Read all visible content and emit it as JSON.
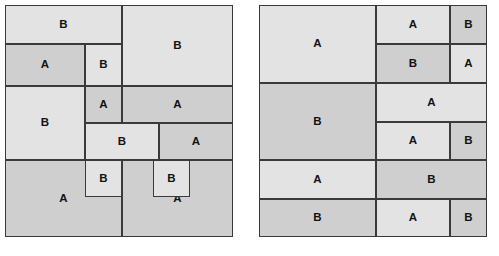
{
  "figure": {
    "background": "#ffffff",
    "stroke_color": "#3a3a3a",
    "shade_light": "#e3e3e3",
    "shade_dark": "#cfcfcf",
    "label_a": "A",
    "label_b": "B",
    "caption_left": "",
    "caption_right": ""
  },
  "panels": [
    {
      "name": "left-partition",
      "x": 5,
      "y": 5,
      "w": 228,
      "h": 232,
      "rects": [
        {
          "id": "l1",
          "label": "B",
          "shade": "light",
          "x": 0,
          "y": 0,
          "w": 117,
          "h": 39
        },
        {
          "id": "l2",
          "label": "A",
          "shade": "dark",
          "x": 0,
          "y": 39,
          "w": 80,
          "h": 42
        },
        {
          "id": "l3",
          "label": "B",
          "shade": "light",
          "x": 80,
          "y": 39,
          "w": 37,
          "h": 42
        },
        {
          "id": "l4",
          "label": "B",
          "shade": "light",
          "x": 117,
          "y": 0,
          "w": 111,
          "h": 81
        },
        {
          "id": "l5",
          "label": "B",
          "shade": "light",
          "x": 0,
          "y": 81,
          "w": 80,
          "h": 74
        },
        {
          "id": "l6",
          "label": "A",
          "shade": "dark",
          "x": 80,
          "y": 81,
          "w": 37,
          "h": 37
        },
        {
          "id": "l7",
          "label": "A",
          "shade": "dark",
          "x": 117,
          "y": 81,
          "w": 111,
          "h": 37
        },
        {
          "id": "l8",
          "label": "B",
          "shade": "light",
          "x": 80,
          "y": 118,
          "w": 74,
          "h": 37
        },
        {
          "id": "l9",
          "label": "A",
          "shade": "dark",
          "x": 154,
          "y": 118,
          "w": 74,
          "h": 37
        },
        {
          "id": "l10",
          "label": "A",
          "shade": "dark",
          "x": 0,
          "y": 155,
          "w": 117,
          "h": 77
        },
        {
          "id": "l11",
          "label": "B",
          "shade": "light",
          "x": 80,
          "y": 155,
          "w": 37,
          "h": 37
        },
        {
          "id": "l12",
          "label": "A",
          "shade": "dark",
          "x": 117,
          "y": 155,
          "w": 111,
          "h": 77
        },
        {
          "id": "l13",
          "label": "B",
          "shade": "light",
          "x": 148,
          "y": 155,
          "w": 37,
          "h": 37
        }
      ]
    },
    {
      "name": "right-partition",
      "x": 259,
      "y": 5,
      "w": 228,
      "h": 232,
      "rects": [
        {
          "id": "r1",
          "label": "A",
          "shade": "light",
          "x": 0,
          "y": 0,
          "w": 117,
          "h": 78
        },
        {
          "id": "r2",
          "label": "A",
          "shade": "light",
          "x": 117,
          "y": 0,
          "w": 74,
          "h": 39
        },
        {
          "id": "r3",
          "label": "B",
          "shade": "dark",
          "x": 191,
          "y": 0,
          "w": 37,
          "h": 39
        },
        {
          "id": "r4",
          "label": "B",
          "shade": "dark",
          "x": 117,
          "y": 39,
          "w": 74,
          "h": 39
        },
        {
          "id": "r5",
          "label": "A",
          "shade": "light",
          "x": 191,
          "y": 39,
          "w": 37,
          "h": 39
        },
        {
          "id": "r6",
          "label": "B",
          "shade": "dark",
          "x": 0,
          "y": 78,
          "w": 117,
          "h": 77
        },
        {
          "id": "r7",
          "label": "A",
          "shade": "light",
          "x": 117,
          "y": 78,
          "w": 111,
          "h": 39
        },
        {
          "id": "r8",
          "label": "A",
          "shade": "light",
          "x": 117,
          "y": 117,
          "w": 74,
          "h": 38
        },
        {
          "id": "r9",
          "label": "B",
          "shade": "dark",
          "x": 191,
          "y": 117,
          "w": 37,
          "h": 38
        },
        {
          "id": "r10",
          "label": "A",
          "shade": "light",
          "x": 0,
          "y": 155,
          "w": 117,
          "h": 39
        },
        {
          "id": "r11",
          "label": "B",
          "shade": "dark",
          "x": 117,
          "y": 155,
          "w": 111,
          "h": 39
        },
        {
          "id": "r12",
          "label": "B",
          "shade": "dark",
          "x": 0,
          "y": 194,
          "w": 117,
          "h": 38
        },
        {
          "id": "r13",
          "label": "A",
          "shade": "light",
          "x": 117,
          "y": 194,
          "w": 74,
          "h": 38
        },
        {
          "id": "r14",
          "label": "B",
          "shade": "dark",
          "x": 191,
          "y": 194,
          "w": 37,
          "h": 38
        }
      ]
    }
  ]
}
